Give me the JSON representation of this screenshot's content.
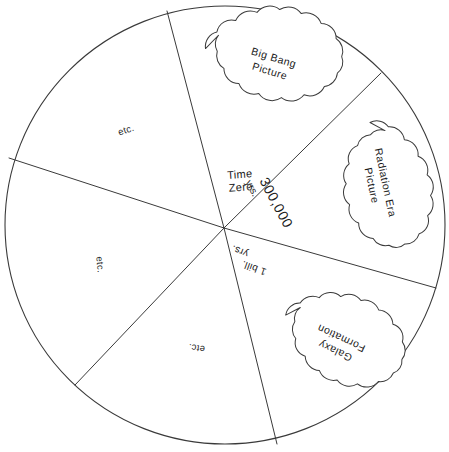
{
  "diagram": {
    "shape": "circle",
    "center_x": 225,
    "center_y": 225,
    "radius": 220,
    "hub_x": 224,
    "hub_y": 228,
    "stroke_color": "#3a3a3a",
    "background_color": "#ffffff",
    "text_color": "#1a1a1a"
  },
  "hub_labels": {
    "time_zero_line1": "Time",
    "time_zero_line2": "Zero",
    "mark_300k_number": "300,000",
    "mark_300k_unit": "yrs.",
    "mark_1bill_number": "1 bill.",
    "mark_1bill_unit": "yrs."
  },
  "clouds": [
    {
      "id": "big-bang",
      "line1": "Big Bang",
      "line2": "Picture",
      "center_x": 272,
      "center_y": 64,
      "rx": 68,
      "ry": 45,
      "rotation": 8
    },
    {
      "id": "radiation-era",
      "line1": "Radiation Era",
      "line2": "Picture",
      "center_x": 379,
      "center_y": 184,
      "rx": 62,
      "ry": 44,
      "rotation": 78
    },
    {
      "id": "galaxy-formation",
      "line1": "Galaxy",
      "line2": "Formation",
      "center_x": 338,
      "center_y": 345,
      "rx": 60,
      "ry": 45,
      "rotation": 205
    }
  ],
  "etc_labels": [
    {
      "id": "etc-upper-left",
      "text": "etc.",
      "x": 127,
      "y": 133,
      "rotation": -18
    },
    {
      "id": "etc-left",
      "text": "etc.",
      "x": 97,
      "y": 265,
      "rotation": 84
    },
    {
      "id": "etc-lower",
      "text": "etc.",
      "x": 197,
      "y": 345,
      "rotation": 188
    }
  ],
  "spokes": [
    {
      "id": "spoke-time-zero",
      "end_x": 167,
      "end_y": 11
    },
    {
      "id": "spoke-300k",
      "end_x": 381,
      "end_y": 73
    },
    {
      "id": "spoke-1bill",
      "end_x": 436,
      "end_y": 288
    },
    {
      "id": "spoke-galaxy-lower",
      "end_x": 277,
      "end_y": 444
    },
    {
      "id": "spoke-lower-left",
      "end_x": 75,
      "end_y": 385
    },
    {
      "id": "spoke-left",
      "end_x": 9,
      "end_y": 158
    }
  ]
}
